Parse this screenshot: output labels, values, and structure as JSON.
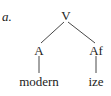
{
  "example_label": "a.",
  "tree": {
    "root": {
      "label": "V"
    },
    "children": [
      {
        "label": "A",
        "leaf": "modern"
      },
      {
        "label": "Af",
        "leaf": "ize"
      }
    ]
  },
  "colors": {
    "text": "#222222",
    "lines": "#333333",
    "background": "#ffffff"
  }
}
